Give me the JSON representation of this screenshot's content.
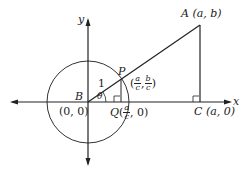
{
  "diagram": {
    "labels": {
      "y_axis": "y",
      "x_axis": "x",
      "A": "A (a, b)",
      "A_letter": "A",
      "A_coords": "(a, b)",
      "B": "B",
      "origin": "(0, 0)",
      "C_letter": "C",
      "C_coords": "(a, 0)",
      "P": "P",
      "Q": "Q",
      "radius": "1",
      "theta": "θ",
      "P_coords": {
        "open": "(",
        "x_num": "a",
        "x_den": "c",
        "sep": ",",
        "y_num": "b",
        "y_den": "c",
        "close": ")"
      },
      "Q_coords": {
        "open": "(",
        "x_num": "a",
        "x_den": "c",
        "rest": ", 0)"
      }
    },
    "colors": {
      "stroke": "#222222",
      "background": "#ffffff"
    }
  }
}
